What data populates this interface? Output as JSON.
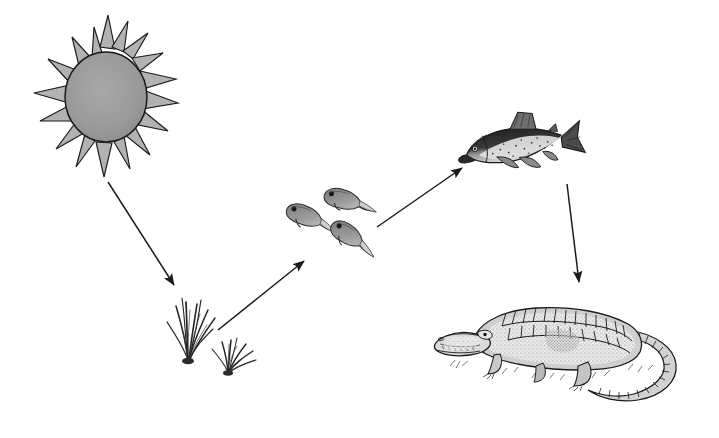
{
  "diagram": {
    "title": "Food chain",
    "type": "food-chain",
    "background_color": "#ffffff",
    "ink_color": "#1a1a1a",
    "style": "pen-and-ink line illustration, grayscale",
    "nodes": [
      {
        "id": "sun",
        "label": "Sun",
        "icon": "sun-icon",
        "role": "energy source",
        "fill_color": "#9a9a9a",
        "ray_fill_color": "#b5b5b5",
        "stroke_color": "#1a1a1a",
        "ray_count": 16,
        "x": 34,
        "y": 17,
        "width": 145,
        "height": 160
      },
      {
        "id": "grass",
        "label": "Grass",
        "icon": "grass-icon",
        "role": "producer",
        "fill_color": "#4a4a4a",
        "stroke_color": "#1a1a1a",
        "tuft_count": 2,
        "x": 158,
        "y": 296,
        "width": 110,
        "height": 82
      },
      {
        "id": "tadpoles",
        "label": "Tadpoles",
        "icon": "tadpole-icon",
        "role": "primary consumer",
        "fill_color": "#8d8d8d",
        "stroke_color": "#2a2a2a",
        "count": 3,
        "x": 282,
        "y": 182,
        "width": 105,
        "height": 80
      },
      {
        "id": "fish",
        "label": "Fish",
        "icon": "fish-icon",
        "role": "secondary consumer",
        "fill_color": "#3c3c3c",
        "belly_color": "#d8d8d8",
        "stroke_color": "#1a1a1a",
        "count": 1,
        "x": 466,
        "y": 110,
        "width": 118,
        "height": 72
      },
      {
        "id": "alligator",
        "label": "Alligator",
        "icon": "alligator-icon",
        "role": "apex predator",
        "fill_color": "#c9c9c9",
        "stroke_color": "#1a1a1a",
        "count": 1,
        "x": 432,
        "y": 300,
        "width": 255,
        "height": 110
      }
    ],
    "arrows": [
      {
        "id": "arrow-sun-to-grass",
        "label": "energy from sun to grass",
        "from": "sun",
        "to": "grass",
        "x1": 108,
        "y1": 182,
        "x2": 177,
        "y2": 289,
        "direction": "down-right",
        "color": "#1a1a1a"
      },
      {
        "id": "arrow-grass-to-tadpoles",
        "label": "grass eaten by tadpoles",
        "from": "grass",
        "to": "tadpoles",
        "x1": 218,
        "y1": 330,
        "x2": 307,
        "y2": 258,
        "direction": "up-right",
        "color": "#1a1a1a"
      },
      {
        "id": "arrow-tadpoles-to-fish",
        "label": "tadpoles eaten by fish",
        "from": "tadpoles",
        "to": "fish",
        "x1": 377,
        "y1": 227,
        "x2": 465,
        "y2": 166,
        "direction": "up-right",
        "color": "#1a1a1a"
      },
      {
        "id": "arrow-fish-to-alligator",
        "label": "fish eaten by alligator",
        "from": "fish",
        "to": "alligator",
        "x1": 567,
        "y1": 184,
        "x2": 580,
        "y2": 285,
        "direction": "down",
        "color": "#1a1a1a"
      }
    ]
  }
}
